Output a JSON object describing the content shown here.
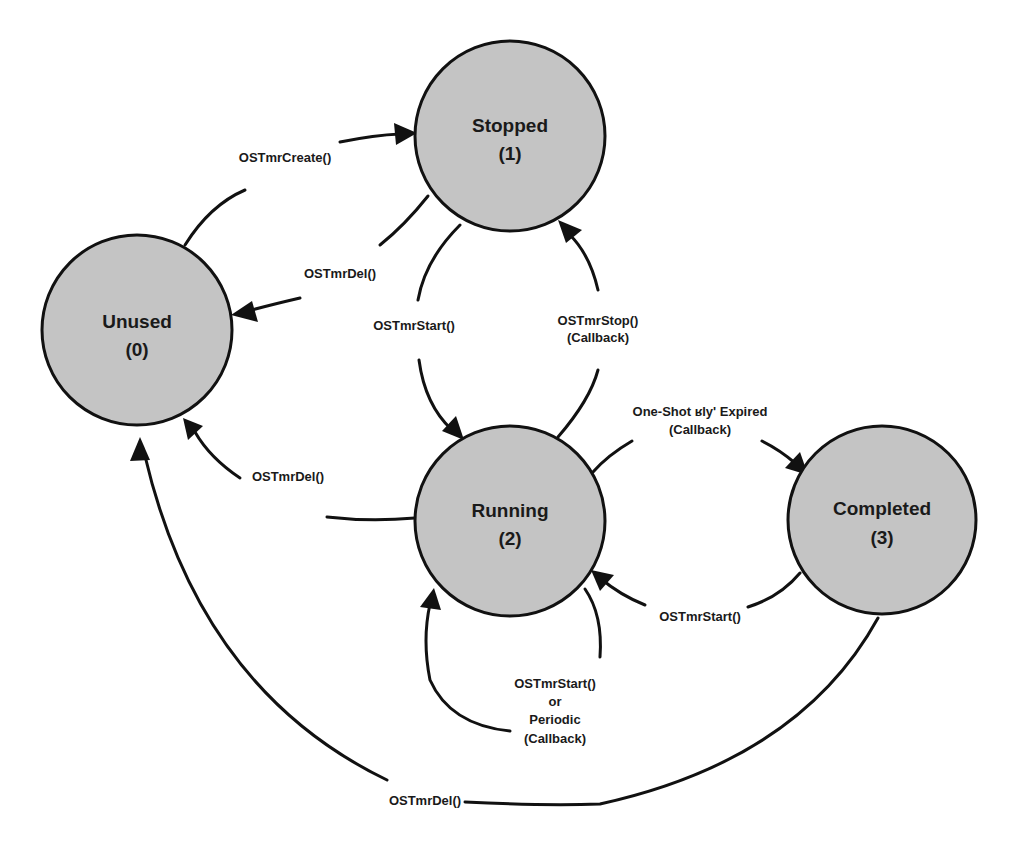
{
  "diagram": {
    "type": "state-transition",
    "colors": {
      "state_fill": "#c4c4c4",
      "stroke": "#111111",
      "background": "#ffffff"
    },
    "states": [
      {
        "id": "unused",
        "name": "Unused",
        "number": "(0)"
      },
      {
        "id": "stopped",
        "name": "Stopped",
        "number": "(1)"
      },
      {
        "id": "running",
        "name": "Running",
        "number": "(2)"
      },
      {
        "id": "completed",
        "name": "Completed",
        "number": "(3)"
      }
    ],
    "transitions": [
      {
        "id": "create",
        "from": "unused",
        "to": "stopped",
        "lines": [
          "OSTmrCreate()"
        ]
      },
      {
        "id": "del_stopped",
        "from": "stopped",
        "to": "unused",
        "lines": [
          "OSTmrDel()"
        ]
      },
      {
        "id": "start_stopped",
        "from": "stopped",
        "to": "running",
        "lines": [
          "OSTmrStart()"
        ]
      },
      {
        "id": "stop_running",
        "from": "running",
        "to": "stopped",
        "lines": [
          "OSTmrStop()",
          "(Callback)"
        ]
      },
      {
        "id": "oneshot",
        "from": "running",
        "to": "completed",
        "lines": [
          "One-Shot ʁly' Expired",
          "(Callback)"
        ]
      },
      {
        "id": "del_running",
        "from": "running",
        "to": "unused",
        "lines": [
          "OSTmrDel()"
        ]
      },
      {
        "id": "start_completed",
        "from": "completed",
        "to": "running",
        "lines": [
          "OSTmrStart()"
        ]
      },
      {
        "id": "self_running",
        "from": "running",
        "to": "running",
        "lines": [
          "OSTmrStart()",
          "or",
          "Periodic",
          "(Callback)"
        ]
      },
      {
        "id": "del_completed",
        "from": "completed",
        "to": "unused",
        "lines": [
          "OSTmrDel()"
        ]
      }
    ]
  }
}
